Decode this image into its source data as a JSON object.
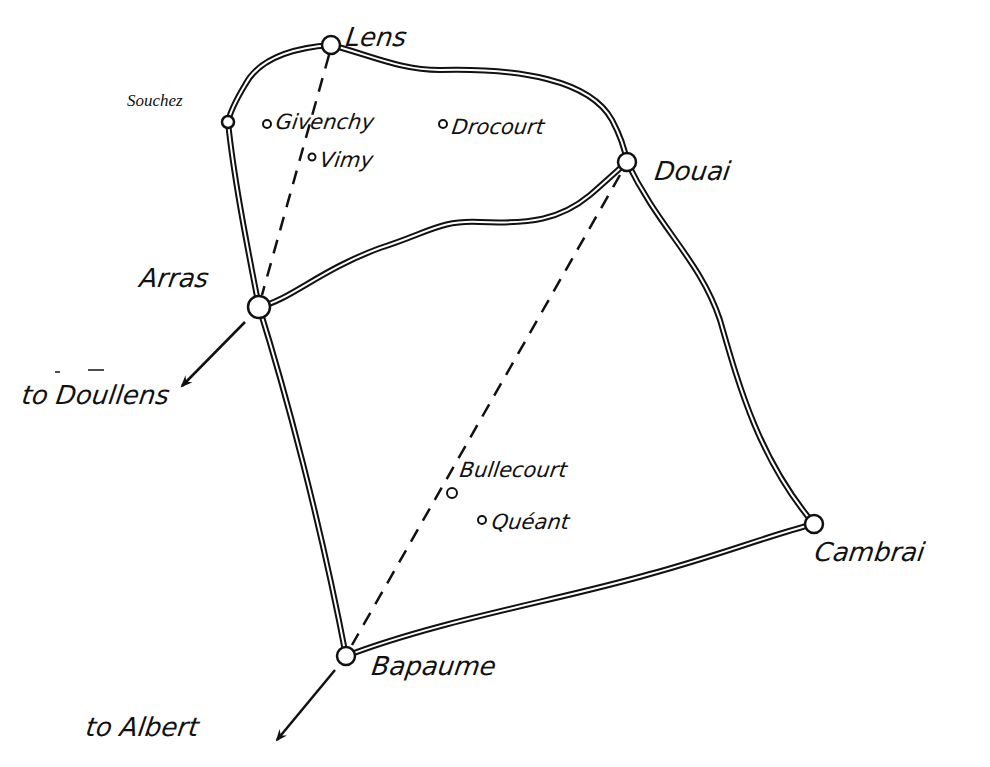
{
  "map": {
    "ink_color": "#111111",
    "background": "#ffffff",
    "towns_major": [
      {
        "name": "Lens",
        "x": 331,
        "y": 45
      },
      {
        "name": "Souchez",
        "x": 228,
        "y": 122
      },
      {
        "name": "Douai",
        "x": 627,
        "y": 162
      },
      {
        "name": "Arras",
        "x": 259,
        "y": 307
      },
      {
        "name": "Cambrai",
        "x": 814,
        "y": 524
      },
      {
        "name": "Bapaume",
        "x": 346,
        "y": 656
      }
    ],
    "villages": [
      {
        "name": "Givenchy",
        "x": 267,
        "y": 124
      },
      {
        "name": "Drocourt",
        "x": 443,
        "y": 124
      },
      {
        "name": "Vimy",
        "x": 312,
        "y": 157
      },
      {
        "name": "Bullecourt",
        "x": 452,
        "y": 493
      },
      {
        "name": "Quéant",
        "x": 482,
        "y": 520
      }
    ],
    "labels": {
      "lens": "Lens",
      "souchez": "Souchez",
      "givenchy": "Givenchy",
      "vimy": "Vimy",
      "drocourt": "Drocourt",
      "douai": "Douai",
      "arras": "Arras",
      "to_doullens": "to Doullens",
      "bullecourt": "Bullecourt",
      "queant": "Quéant",
      "cambrai": "Cambrai",
      "bapaume": "Bapaume",
      "to_albert": "to Albert"
    },
    "roads": [
      "Lens–Souchez–Arras",
      "Lens–Douai",
      "Arras–Douai",
      "Douai–Cambrai",
      "Arras–Bapaume",
      "Bapaume–Cambrai"
    ],
    "dashed_lines": [
      "Lens–Arras",
      "Douai–Bapaume"
    ],
    "arrows": [
      "Arras to Doullens",
      "Bapaume to Albert"
    ]
  }
}
